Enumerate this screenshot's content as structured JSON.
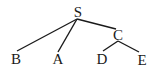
{
  "diagram": {
    "type": "tree",
    "root": "S",
    "nodes": [
      {
        "id": "S",
        "label": "S"
      },
      {
        "id": "B",
        "label": "B"
      },
      {
        "id": "A",
        "label": "A"
      },
      {
        "id": "C",
        "label": "C"
      },
      {
        "id": "D",
        "label": "D"
      },
      {
        "id": "E",
        "label": "E"
      }
    ],
    "edges": [
      {
        "from": "S",
        "to": "B"
      },
      {
        "from": "S",
        "to": "A"
      },
      {
        "from": "S",
        "to": "C"
      },
      {
        "from": "C",
        "to": "D"
      },
      {
        "from": "C",
        "to": "E"
      }
    ]
  }
}
